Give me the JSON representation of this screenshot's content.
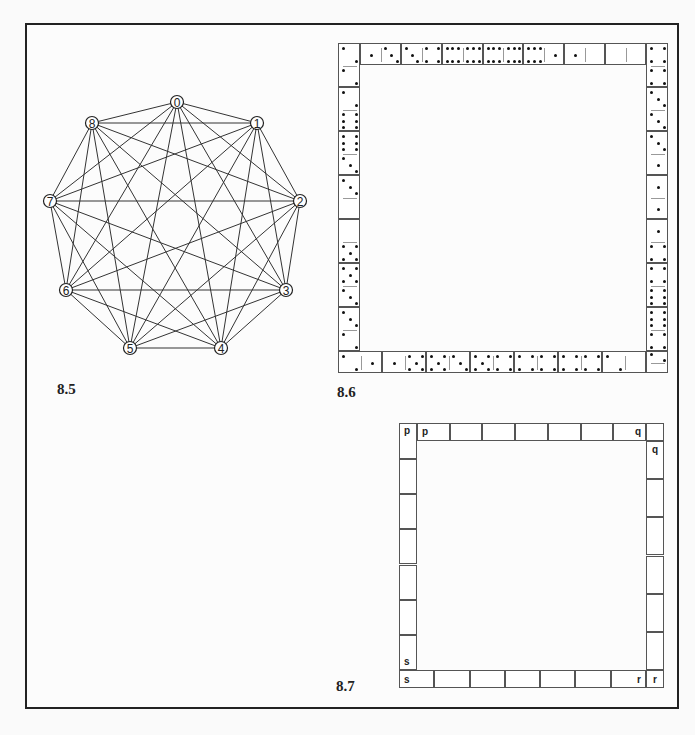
{
  "figures": {
    "fig_8_5": {
      "label": "8.5",
      "type": "complete-graph",
      "nodes": [
        "0",
        "1",
        "2",
        "3",
        "4",
        "5",
        "6",
        "7",
        "8"
      ],
      "edges": "all pairs (K9)"
    },
    "fig_8_6": {
      "label": "8.6",
      "type": "domino-frame",
      "description": "Square ring of dominoes"
    },
    "fig_8_7": {
      "label": "8.7",
      "type": "empty-domino-frame",
      "corner_letters": {
        "top_left": [
          "p",
          "p"
        ],
        "top_right": [
          "q",
          "q"
        ],
        "bottom_left": [
          "s",
          "s"
        ],
        "bottom_right": [
          "r",
          "r"
        ]
      }
    }
  }
}
